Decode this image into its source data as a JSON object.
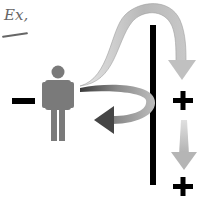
{
  "diagram": {
    "label": "Ex,",
    "left_sign": "minus",
    "right_signs": [
      "plus",
      "plus"
    ],
    "elements": [
      {
        "type": "minus-sign",
        "position": "left of person"
      },
      {
        "type": "person-figure",
        "color": "#7a7a7a"
      },
      {
        "type": "barrier-wall",
        "color": "#000000"
      },
      {
        "type": "arrow-bounce-back",
        "description": "curved arrow from wall back toward person",
        "color": "#555555"
      },
      {
        "type": "arrow-over-wall",
        "description": "arrow curving from person over wall down to plus",
        "color": "#b0b0b0"
      },
      {
        "type": "plus-sign",
        "position": "right of wall, upper"
      },
      {
        "type": "arrow-down",
        "color": "#bbbbbb"
      },
      {
        "type": "plus-sign",
        "position": "right of wall, lower"
      }
    ],
    "colors": {
      "ink": "#000000",
      "person": "#7a7a7a",
      "arrow_dark": "#4a4a4a",
      "arrow_light": "#b5b5b5"
    }
  }
}
